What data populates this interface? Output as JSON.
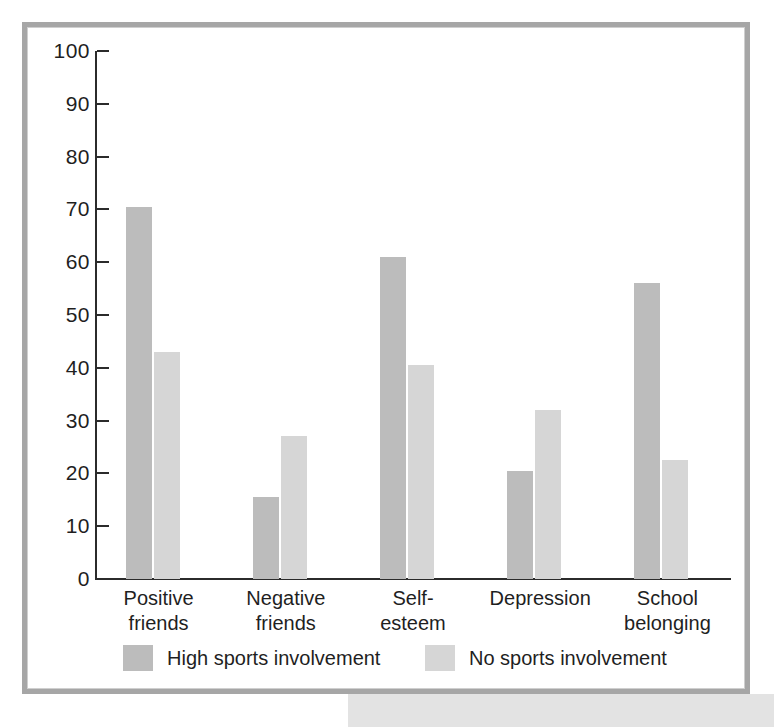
{
  "chart_data": {
    "type": "bar",
    "title": "",
    "subtitle": "",
    "xlabel": "",
    "ylabel": "",
    "ylim": [
      0,
      100
    ],
    "ytick_step": 10,
    "yticks": [
      100,
      90,
      80,
      70,
      60,
      50,
      40,
      30,
      20,
      10,
      0
    ],
    "grid": false,
    "legend_position": "bottom",
    "categories": [
      "Positive\nfriends",
      "Negative\nfriends",
      "Self-\nesteem",
      "Depression",
      "School\nbelonging"
    ],
    "category_labels": [
      {
        "line1": "Positive",
        "line2": "friends"
      },
      {
        "line1": "Negative",
        "line2": "friends"
      },
      {
        "line1": "Self-",
        "line2": "esteem"
      },
      {
        "line1": "Depression",
        "line2": ""
      },
      {
        "line1": "School",
        "line2": "belonging"
      }
    ],
    "series": [
      {
        "name": "High sports involvement",
        "color": "#bcbcbc",
        "values": [
          70.5,
          15.5,
          61,
          20.5,
          56
        ]
      },
      {
        "name": "No sports involvement",
        "color": "#d6d6d6",
        "values": [
          43,
          27,
          40.5,
          32,
          22.5
        ]
      }
    ]
  },
  "legend": {
    "items": [
      {
        "label": "High sports involvement",
        "color": "#bcbcbc"
      },
      {
        "label": "No sports involvement",
        "color": "#d6d6d6"
      }
    ]
  },
  "colors": {
    "series_high": "#bcbcbc",
    "series_none": "#d6d6d6",
    "axis": "#2b2b2b",
    "frame": "#a6a6a6",
    "text": "#1f1f1f",
    "background": "#ffffff"
  }
}
